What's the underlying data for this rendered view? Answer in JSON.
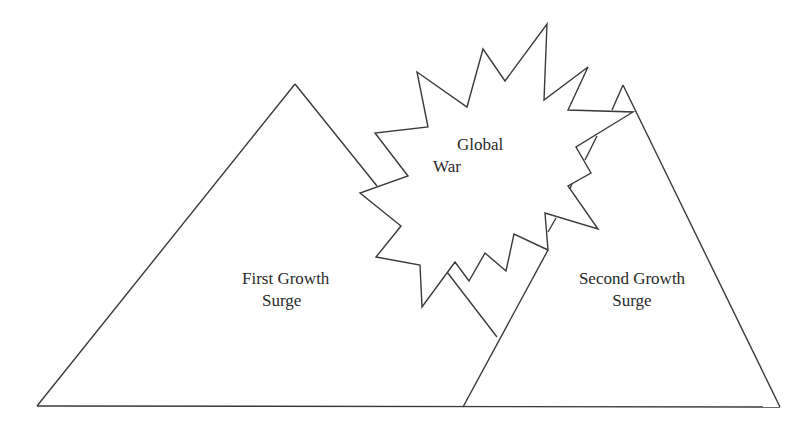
{
  "diagram": {
    "shapes": [
      {
        "id": "first-growth-surge",
        "type": "triangle",
        "label_lines": [
          "First Growth",
          "Surge"
        ]
      },
      {
        "id": "second-growth-surge",
        "type": "triangle",
        "label_lines": [
          "Second Growth",
          "Surge"
        ]
      },
      {
        "id": "global-war",
        "type": "starburst",
        "label_lines": [
          "Global",
          "War"
        ]
      }
    ],
    "colors": {
      "stroke": "#3a3a3a",
      "background": "#ffffff",
      "text": "#2a2a2a"
    }
  }
}
